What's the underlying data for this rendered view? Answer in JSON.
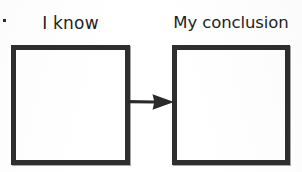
{
  "worksheet": {
    "type": "two-column-graphic-organizer",
    "background_color": "#ffffff",
    "ink_color": "#2e2e2e",
    "text_color": "#1e1e1e"
  },
  "columns": [
    {
      "id": "known",
      "label": "I know",
      "box_value": "",
      "box_placeholder": ""
    },
    {
      "id": "conclusion",
      "label": "My conclusion",
      "box_value": "",
      "box_placeholder": ""
    }
  ],
  "connector": {
    "icon": "arrow-right-icon",
    "direction": "right",
    "from": "known",
    "to": "conclusion",
    "color": "#2e2e2e"
  },
  "artifacts": {
    "speck": "scan-speck"
  }
}
